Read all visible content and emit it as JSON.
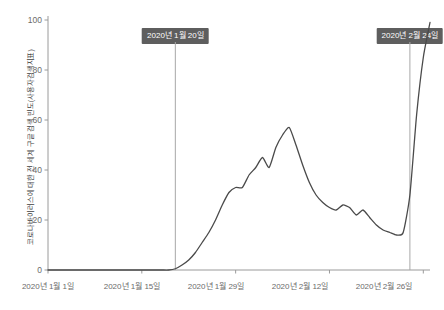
{
  "chart_data": {
    "type": "line",
    "title": "",
    "xlabel": "",
    "ylabel": "코로나바이러스에 대한 전 세계 구글 검색 빈도(사용자검색지표)",
    "ylim": [
      0,
      100
    ],
    "yticks": [
      "0",
      "20",
      "40",
      "60",
      "80",
      "100"
    ],
    "ytick_values": [
      0,
      20,
      40,
      60,
      80,
      100
    ],
    "xticks": [
      "2020년 1월 1일",
      "2020년 1월 15일",
      "2020년 1월 29일",
      "2020년 2월 12일",
      "2020년 2월 26일"
    ],
    "xtick_days": [
      0,
      14,
      28,
      42,
      56
    ],
    "grid": false,
    "legend": false,
    "line_color": "#4a4a4a",
    "annotation_box_color": "#5e5e5e",
    "annotation_text_color": "#ffffff",
    "annotations": [
      {
        "label": "2020년 1월 20일",
        "day": 19
      },
      {
        "label": "2020년 2월 24일",
        "day": 54
      }
    ],
    "x": [
      0,
      1,
      2,
      3,
      4,
      5,
      6,
      7,
      8,
      9,
      10,
      11,
      12,
      13,
      14,
      15,
      16,
      17,
      18,
      19,
      20,
      21,
      22,
      23,
      24,
      25,
      26,
      27,
      28,
      29,
      30,
      31,
      32,
      33,
      34,
      35,
      36,
      37,
      38,
      39,
      40,
      41,
      42,
      43,
      44,
      45,
      46,
      47,
      48,
      49,
      50,
      51,
      52,
      53,
      54,
      55,
      56,
      57
    ],
    "values": [
      0,
      0,
      0,
      0,
      0,
      0,
      0,
      0,
      0,
      0,
      0,
      0,
      0,
      0,
      0,
      0,
      0,
      0,
      0,
      0.5,
      2,
      4,
      7,
      11,
      15,
      20,
      26,
      31,
      33,
      33,
      38,
      41,
      45,
      41,
      49,
      54,
      57,
      50,
      42,
      35,
      30,
      27,
      25,
      24,
      26,
      25,
      22,
      24,
      21,
      18,
      16,
      15,
      14,
      15,
      30,
      62,
      85,
      99
    ],
    "note": "Flat near 0 until Jan 20, first peak ~57 around Jan 29-31, decline to ~14 mid-Feb, steep rise to ~100 by Feb 26"
  }
}
